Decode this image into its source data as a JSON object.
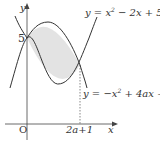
{
  "diagram": {
    "axes": {
      "x_label": "x",
      "y_label": "y",
      "origin_label": "O"
    },
    "y_intercept_label": "5",
    "x_intersection_label": "2a+1",
    "curves": [
      {
        "name": "upward-parabola",
        "eq_prefix": "y = x",
        "exp": "2",
        "eq_suffix": " − 2x + 5"
      },
      {
        "name": "downward-parabola",
        "eq_prefix": "y = −x",
        "exp": "2",
        "eq_suffix": " + 4ax + 5"
      }
    ],
    "shaded_region": "area between the two parabolas from x = 0 to x = 2a+1",
    "colors": {
      "curve": "#333333",
      "shade": "#e3e3e3",
      "axis": "#444444"
    }
  }
}
